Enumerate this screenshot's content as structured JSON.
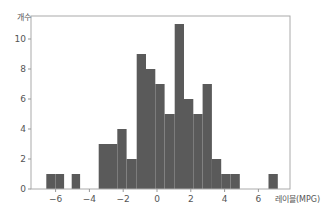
{
  "chart_data": {
    "type": "bar",
    "title": "",
    "xlabel": "레이블(MPG)",
    "ylabel": "개수",
    "xlim": [
      -7.4,
      7.9
    ],
    "ylim": [
      0,
      11.6
    ],
    "grid": false,
    "legend": null,
    "xticks": [
      -6,
      -4,
      -2,
      0,
      2,
      4,
      6
    ],
    "xtick_labels": [
      "−6",
      "−4",
      "−2",
      "0",
      "2",
      "4",
      "6"
    ],
    "yticks": [
      0,
      2,
      4,
      6,
      8,
      10
    ],
    "ytick_labels": [
      "0",
      "2",
      "4",
      "6",
      "8",
      "10"
    ],
    "bar_color": "#5a5a5a",
    "bins": [
      {
        "start": -6.55,
        "end": -6.0,
        "count": 1
      },
      {
        "start": -6.0,
        "end": -5.5,
        "count": 1
      },
      {
        "start": -5.05,
        "end": -4.55,
        "count": 1
      },
      {
        "start": -3.45,
        "end": -2.9,
        "count": 3
      },
      {
        "start": -2.9,
        "end": -2.35,
        "count": 3
      },
      {
        "start": -2.35,
        "end": -1.8,
        "count": 4
      },
      {
        "start": -1.8,
        "end": -1.2,
        "count": 2
      },
      {
        "start": -1.2,
        "end": -0.65,
        "count": 9
      },
      {
        "start": -0.65,
        "end": -0.1,
        "count": 8
      },
      {
        "start": -0.1,
        "end": 0.45,
        "count": 7
      },
      {
        "start": 0.45,
        "end": 1.05,
        "count": 5
      },
      {
        "start": 1.05,
        "end": 1.6,
        "count": 11
      },
      {
        "start": 1.6,
        "end": 2.15,
        "count": 6
      },
      {
        "start": 2.15,
        "end": 2.7,
        "count": 5
      },
      {
        "start": 2.7,
        "end": 3.25,
        "count": 7
      },
      {
        "start": 3.25,
        "end": 3.8,
        "count": 2
      },
      {
        "start": 3.8,
        "end": 4.35,
        "count": 1
      },
      {
        "start": 4.35,
        "end": 4.9,
        "count": 1
      },
      {
        "start": 6.6,
        "end": 7.15,
        "count": 1
      }
    ]
  }
}
